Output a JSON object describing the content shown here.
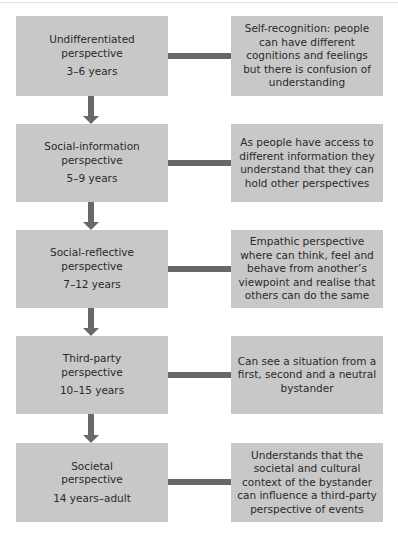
{
  "stages": [
    {
      "name": "Undifferentiated",
      "title_line1": "Undifferentiated",
      "title_line2": "perspective",
      "age": "3–6 years",
      "description": "Self-recognition: people can have different cognitions and feelings but there is confusion of understanding"
    },
    {
      "name": "Social-information",
      "title_line1": "Social-information",
      "title_line2": "perspective",
      "age": "5–9 years",
      "description": "As people have access to different information they understand that they can hold other perspectives"
    },
    {
      "name": "Social-reflective",
      "title_line1": "Social-reflective",
      "title_line2": "perspective",
      "age": "7–12 years",
      "description": "Empathic perspective where can think, feel and behave from another’s viewpoint and realise that others can do the same"
    },
    {
      "name": "Third-party",
      "title_line1": "Third-party",
      "title_line2": "perspective",
      "age": "10–15 years",
      "description": "Can see a situation from a first, second and a neutral bystander"
    },
    {
      "name": "Societal",
      "title_line1": "Societal",
      "title_line2": "perspective",
      "age": "14 years–adult",
      "description": "Understands that the societal and cultural context of the bystander can influence a third-party perspective of events"
    }
  ],
  "colors": {
    "box_fill": "#c8c8c8",
    "connector": "#686868",
    "text": "#2a2a2a"
  }
}
